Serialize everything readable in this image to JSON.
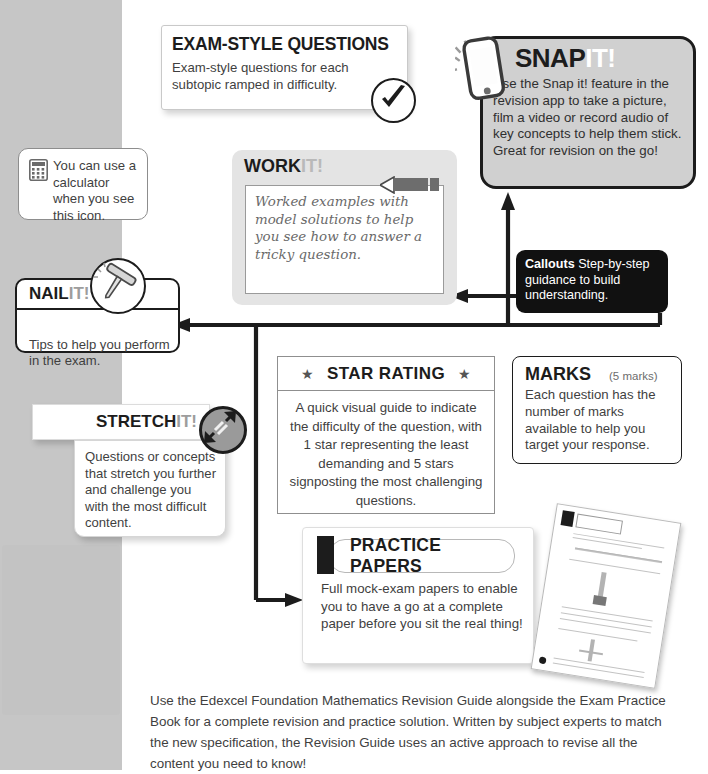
{
  "page": {
    "background_gray": "#c6c6c6",
    "background_white": "#ffffff"
  },
  "exam_card": {
    "title": "EXAM-STYLE QUESTIONS",
    "body": "Exam-style questions for each subtopic ramped in difficulty.",
    "icon": "tick-icon"
  },
  "snap_card": {
    "title_main": "SNAP",
    "title_accent": "IT!",
    "body": "Use the Snap it! feature in the revision app to take a picture, film a video or record audio of key concepts to help them stick. Great for revision on the go!",
    "icon": "phone-icon",
    "bg": "#d0d0d0",
    "accent": "#ffffff"
  },
  "calculator_note": {
    "body": "You can use a calculator when you see this icon.",
    "icon": "calculator-icon"
  },
  "work_card": {
    "title_main": "WORK",
    "title_accent": "IT!",
    "body": "Worked examples with model solutions to help you see how to answer a tricky question.",
    "icon": "pencil-icon",
    "bg": "#e4e4e4",
    "accent": "#b9b9b9"
  },
  "callouts_card": {
    "label": "Callouts",
    "body": " Step-by-step guidance to build understanding.",
    "bg": "#111111"
  },
  "nail_card": {
    "title_main": "NAIL",
    "title_accent": "IT!",
    "body": "Tips to help you perform in the exam.",
    "icon": "nail-icon",
    "accent": "#9d9d9d"
  },
  "star_card": {
    "title": "STAR RATING",
    "star_left": "★",
    "star_right": "★",
    "body": "A quick visual guide to indicate the difficulty of the question, with 1 star representing the least demanding and 5 stars signposting the most challenging questions."
  },
  "marks_card": {
    "title": "MARKS",
    "marks_value": "(5 marks)",
    "body": "Each question has the number of marks available to help you target your response."
  },
  "stretch_card": {
    "title_main": "STRETCH",
    "title_accent": "IT!",
    "body": "Questions or concepts that stretch you further and challenge you with the most difficult content.",
    "icon": "stretch-arrows-icon",
    "accent": "#9d9d9d"
  },
  "practice_papers_card": {
    "title": "PRACTICE PAPERS",
    "body": "Full mock-exam papers to enable you to have a go at a complete paper before you sit the real thing!",
    "thumbnail": "practice-paper-thumbnail"
  },
  "footer": {
    "text": "Use the Edexcel Foundation Mathematics Revision Guide alongside the Exam Practice Book for a complete revision and practice solution. Written by subject experts to match the new specification, the Revision Guide uses an active approach to revise all the content you need to know!"
  }
}
